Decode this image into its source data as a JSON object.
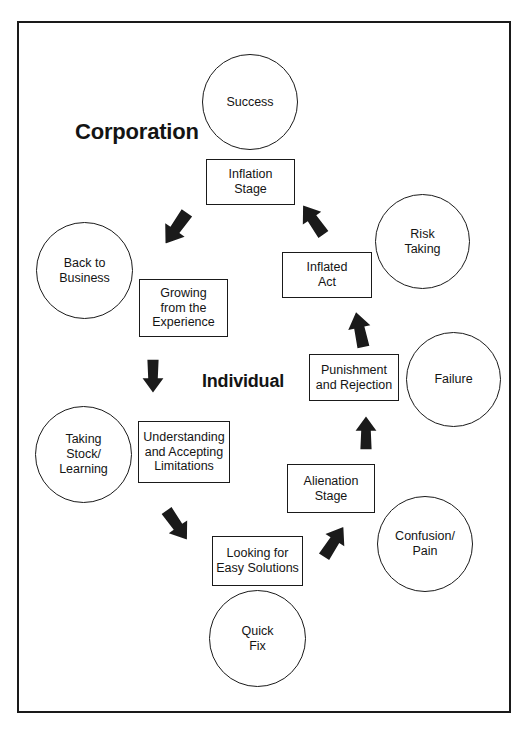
{
  "diagram": {
    "title_labels": [
      {
        "id": "corporation",
        "text": "Corporation",
        "x": 73,
        "y": 117,
        "size": 22
      },
      {
        "id": "individual",
        "text": "Individual",
        "x": 200,
        "y": 369,
        "size": 18
      }
    ],
    "circles": [
      {
        "id": "success",
        "label": "Success",
        "x": 200,
        "y": 52,
        "size": 96
      },
      {
        "id": "risk-taking",
        "label": "Risk\nTaking",
        "x": 373,
        "y": 192,
        "size": 95
      },
      {
        "id": "back-to-business",
        "label": "Back to\nBusiness",
        "x": 34,
        "y": 220,
        "size": 97
      },
      {
        "id": "failure",
        "label": "Failure",
        "x": 404,
        "y": 330,
        "size": 95
      },
      {
        "id": "taking-stock",
        "label": "Taking\nStock/\nLearning",
        "x": 33,
        "y": 404,
        "size": 97
      },
      {
        "id": "confusion-pain",
        "label": "Confusion/\nPain",
        "x": 375,
        "y": 494,
        "size": 96
      },
      {
        "id": "quick-fix",
        "label": "Quick\nFix",
        "x": 207,
        "y": 588,
        "size": 97
      }
    ],
    "boxes": [
      {
        "id": "inflation-stage",
        "label": "Inflation\nStage",
        "x": 204,
        "y": 157,
        "w": 89,
        "h": 46
      },
      {
        "id": "inflated-act",
        "label": "Inflated\nAct",
        "x": 280,
        "y": 250,
        "w": 90,
        "h": 46
      },
      {
        "id": "growing-from-experience",
        "label": "Growing\nfrom the\nExperience",
        "x": 137,
        "y": 277,
        "w": 89,
        "h": 58
      },
      {
        "id": "punishment-rejection",
        "label": "Punishment\nand Rejection",
        "x": 307,
        "y": 352,
        "w": 90,
        "h": 47
      },
      {
        "id": "understanding-limitations",
        "label": "Understanding\nand Accepting\nLimitations",
        "x": 136,
        "y": 419,
        "w": 92,
        "h": 62
      },
      {
        "id": "alienation-stage",
        "label": "Alienation\nStage",
        "x": 285,
        "y": 462,
        "w": 88,
        "h": 49
      },
      {
        "id": "looking-easy-solutions",
        "label": "Looking for\nEasy Solutions",
        "x": 210,
        "y": 534,
        "w": 91,
        "h": 50
      }
    ],
    "arrows": [
      {
        "id": "arrow-up-right-to-inflation",
        "x": 160,
        "y": 205,
        "w": 30,
        "h": 40,
        "angle": 35,
        "from": "growing-from-experience",
        "to": "inflation-stage"
      },
      {
        "id": "arrow-down-right-to-inflated-act",
        "x": 297,
        "y": 200,
        "w": 30,
        "h": 38,
        "angle": 145,
        "from": "inflation-stage",
        "to": "inflated-act"
      },
      {
        "id": "arrow-down-to-punishment",
        "x": 345,
        "y": 308,
        "w": 26,
        "h": 42,
        "angle": 168,
        "from": "inflated-act",
        "to": "punishment-rejection"
      },
      {
        "id": "arrow-down-to-alienation",
        "x": 352,
        "y": 411,
        "w": 24,
        "h": 42,
        "angle": 180,
        "from": "punishment-rejection",
        "to": "alienation-stage"
      },
      {
        "id": "arrow-down-left-to-looking",
        "x": 316,
        "y": 522,
        "w": 30,
        "h": 38,
        "angle": 213,
        "from": "alienation-stage",
        "to": "looking-easy-solutions"
      },
      {
        "id": "arrow-up-left-to-understanding",
        "x": 158,
        "y": 503,
        "w": 32,
        "h": 38,
        "angle": 325,
        "from": "looking-easy-solutions",
        "to": "understanding-limitations"
      },
      {
        "id": "arrow-up-to-growing",
        "x": 139,
        "y": 352,
        "w": 24,
        "h": 42,
        "angle": 0,
        "from": "understanding-limitations",
        "to": "growing-from-experience"
      }
    ],
    "colors": {
      "stroke": "#1a1a1a",
      "fill": "#ffffff",
      "text": "#141414"
    }
  }
}
